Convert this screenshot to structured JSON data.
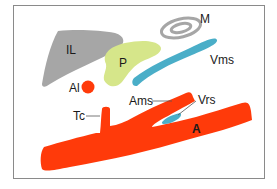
{
  "diagram": {
    "colors": {
      "frame": "#8a8a8a",
      "artery": "#ff3a0a",
      "vein": "#4aaec8",
      "pancreas": "#d6e68a",
      "liver": "#a6a6a6",
      "intestine": "#a6a6a6",
      "leader_line": "#555555"
    },
    "labels": {
      "M": "M",
      "IL": "IL",
      "P": "P",
      "Vms": "Vms",
      "Al": "Al",
      "Ams": "Ams",
      "Vrs": "Vrs",
      "Tc": "Tc",
      "A": "A"
    }
  }
}
